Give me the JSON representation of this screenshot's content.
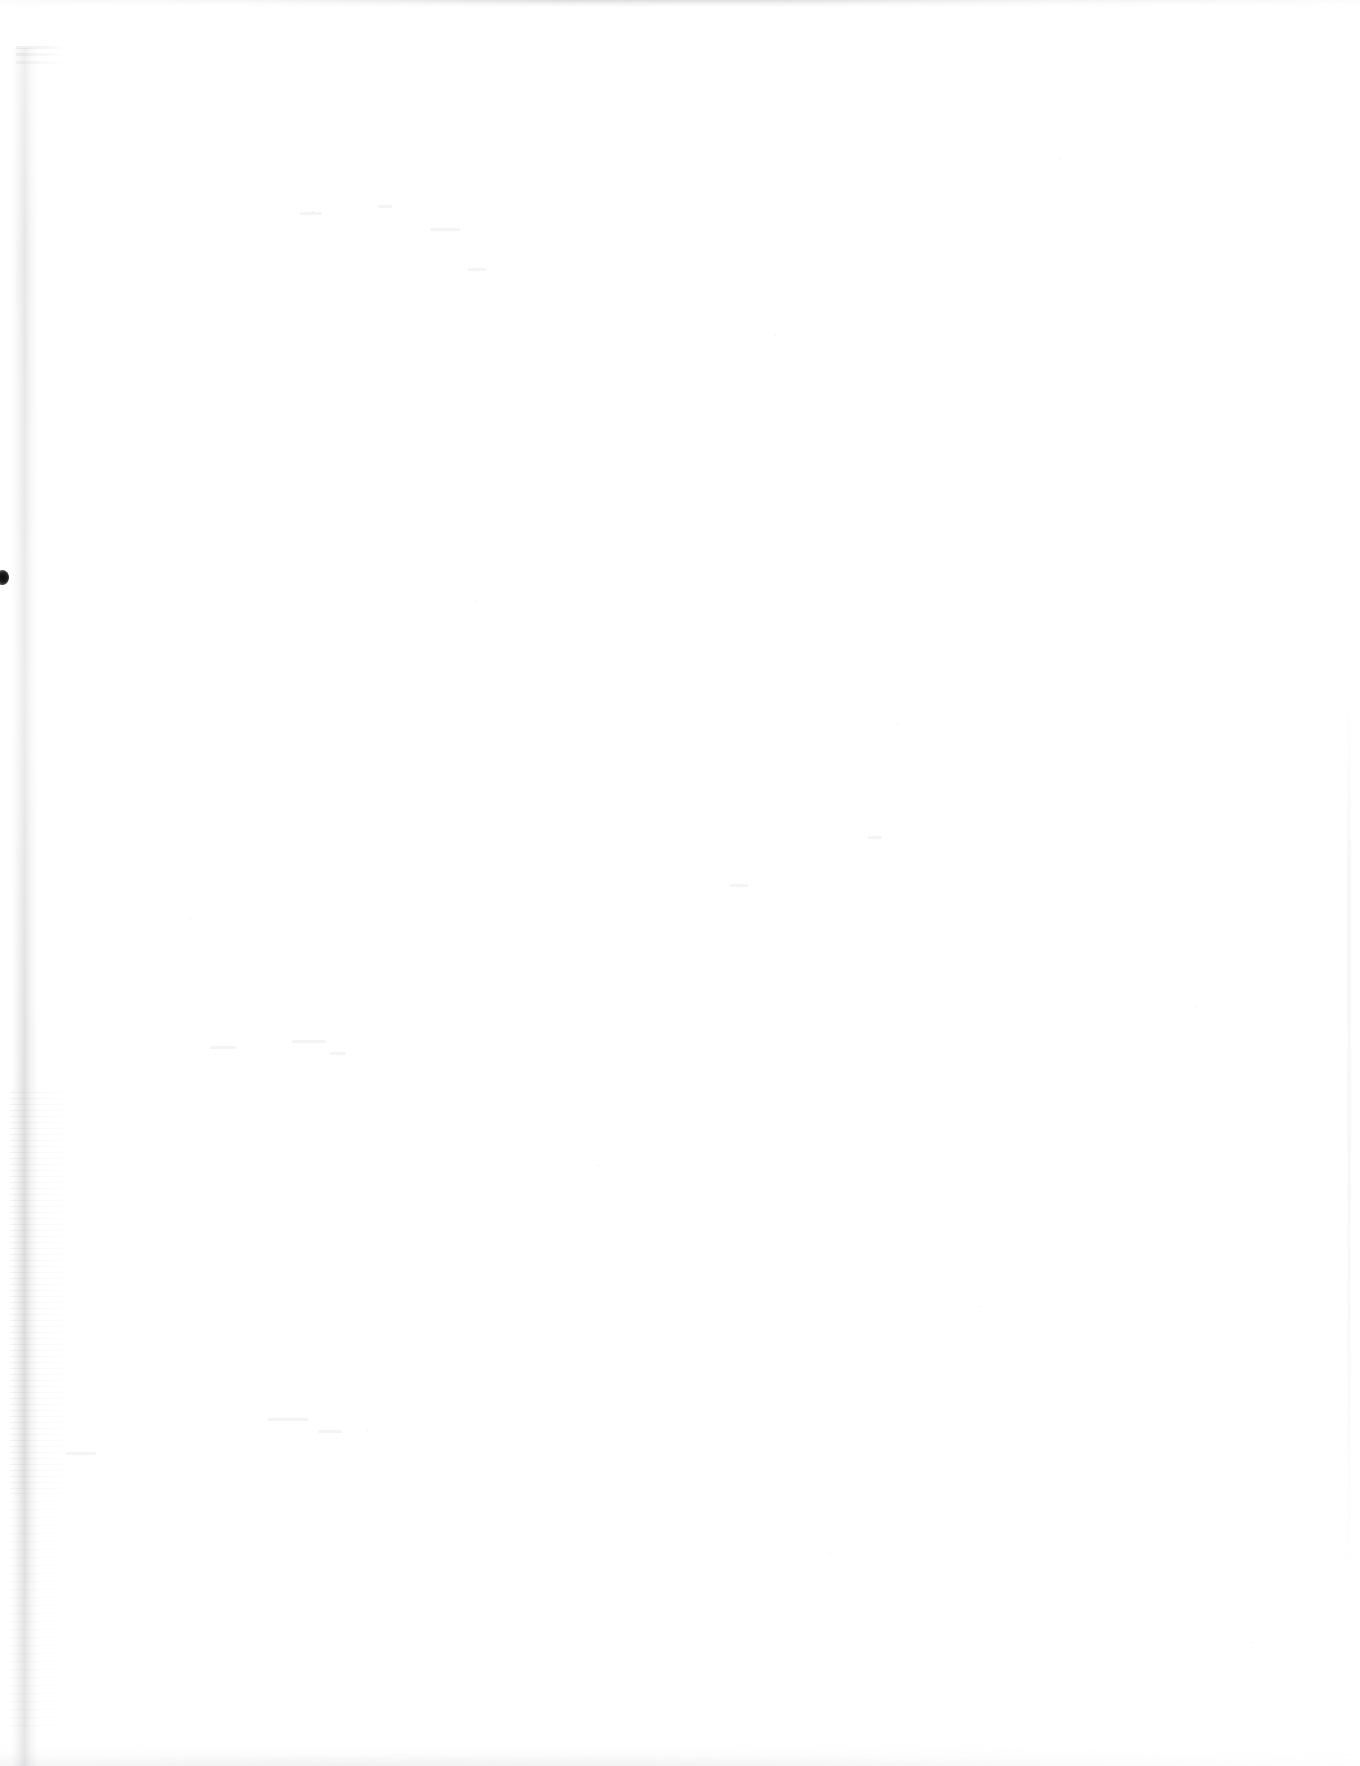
{
  "document": {
    "kind": "scanned-page",
    "page_content": "",
    "is_blank": true,
    "width": 1360,
    "height": 1766
  },
  "colors": {
    "paper": "#ffffff",
    "gutter_shadow": "#8c8c92",
    "ink_blot": "#0b0b0b",
    "edge_artifact": "#aaaab0",
    "speckle": "#96969b"
  },
  "artifacts": {
    "gutter": {
      "name": "left-binding-gutter",
      "x": 12,
      "y": 48,
      "width": 26,
      "height": 1718
    },
    "ink_blot": {
      "name": "ink-blot",
      "x": -4,
      "y": 570,
      "width": 13,
      "height": 15
    },
    "top_band": {
      "name": "top-edge-band",
      "x": 0,
      "y": 0,
      "width": 1360,
      "height": 7
    },
    "bottom_band": {
      "name": "bottom-edge-band",
      "x": 0,
      "y": 1744,
      "width": 1360,
      "height": 22
    },
    "right_line": {
      "name": "right-edge-line",
      "x": 1346,
      "y": 690,
      "width": 6,
      "height": 900
    },
    "smudge": {
      "name": "top-left-smudge",
      "x": 16,
      "y": 46,
      "width": 48,
      "height": 24
    },
    "ghost_marks": [
      {
        "x": 300,
        "y": 212,
        "width": 22,
        "height": 3
      },
      {
        "x": 378,
        "y": 205,
        "width": 14,
        "height": 3
      },
      {
        "x": 430,
        "y": 228,
        "width": 30,
        "height": 3
      },
      {
        "x": 468,
        "y": 268,
        "width": 18,
        "height": 3
      },
      {
        "x": 210,
        "y": 1046,
        "width": 26,
        "height": 3
      },
      {
        "x": 292,
        "y": 1040,
        "width": 34,
        "height": 3
      },
      {
        "x": 330,
        "y": 1052,
        "width": 16,
        "height": 3
      },
      {
        "x": 268,
        "y": 1418,
        "width": 40,
        "height": 3
      },
      {
        "x": 318,
        "y": 1430,
        "width": 24,
        "height": 3
      },
      {
        "x": 66,
        "y": 1452,
        "width": 30,
        "height": 3
      },
      {
        "x": 730,
        "y": 884,
        "width": 18,
        "height": 3
      },
      {
        "x": 868,
        "y": 836,
        "width": 14,
        "height": 3
      }
    ]
  }
}
